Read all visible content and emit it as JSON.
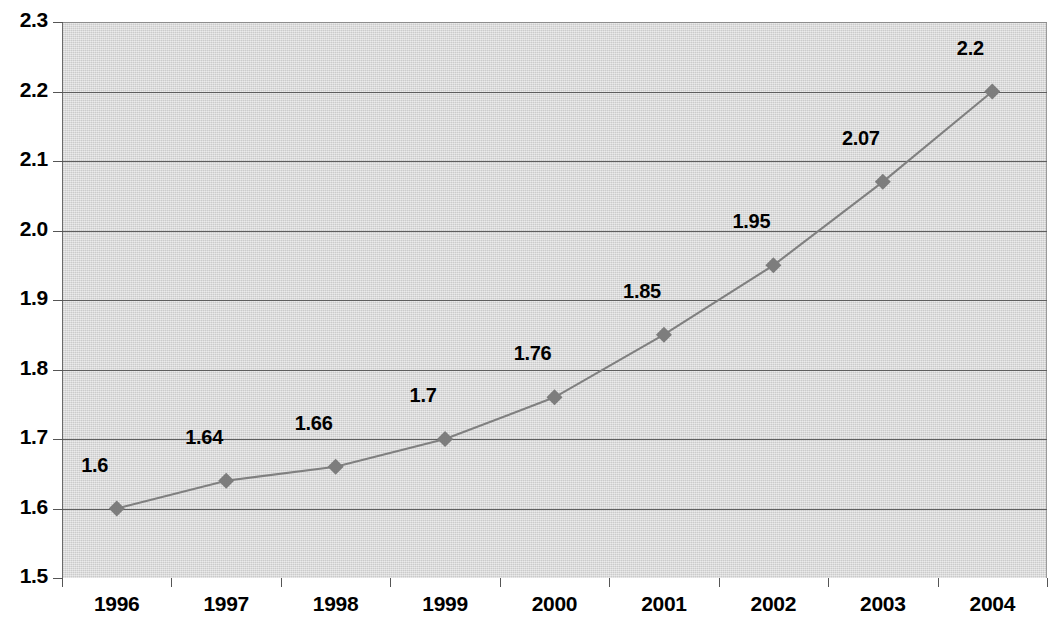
{
  "chart_data": {
    "type": "line",
    "title": "",
    "subtitle": "",
    "xlabel": "",
    "ylabel": "",
    "categories": [
      "1996",
      "1997",
      "1998",
      "1999",
      "2000",
      "2001",
      "2002",
      "2003",
      "2004"
    ],
    "values": [
      1.6,
      1.64,
      1.66,
      1.7,
      1.76,
      1.85,
      1.95,
      2.07,
      2.2
    ],
    "point_labels": [
      "1.6",
      "1.64",
      "1.66",
      "1.7",
      "1.76",
      "1.85",
      "1.95",
      "2.07",
      "2.2"
    ],
    "series": [
      {
        "name": "",
        "values": [
          1.6,
          1.64,
          1.66,
          1.7,
          1.76,
          1.85,
          1.95,
          2.07,
          2.2
        ]
      }
    ],
    "ylim": [
      1.5,
      2.3
    ],
    "ytick_labels": [
      "1.5",
      "1.6",
      "1.7",
      "1.8",
      "1.9",
      "2.0",
      "2.1",
      "2.2",
      "2.3"
    ],
    "ytick_values": [
      1.5,
      1.6,
      1.7,
      1.8,
      1.9,
      2.0,
      2.1,
      2.2,
      2.3
    ],
    "grid": true,
    "grid_axis": "y",
    "legend": false,
    "legend_position": "none",
    "marker": "diamond",
    "data_labels_shown": true
  },
  "style": {
    "series_color": "#808080",
    "marker_color": "#7d7d7d",
    "plot_background": "#d8d8d8",
    "page_background": "#ffffff",
    "gridline_color": "#5e5e5e",
    "text_color": "#000000"
  }
}
